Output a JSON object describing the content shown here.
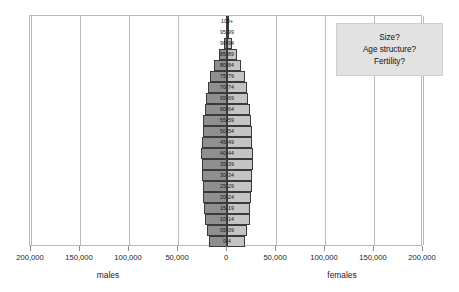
{
  "chart_data": {
    "type": "bar",
    "chart_subtype": "population-pyramid",
    "title": "",
    "xlabel": "",
    "ylabel": "",
    "xlim": [
      -200000,
      200000
    ],
    "grid": true,
    "legend_position": "none",
    "axis_side_labels": {
      "left": "males",
      "right": "females"
    },
    "xticks": [
      -200000,
      -150000,
      -100000,
      -50000,
      0,
      50000,
      100000,
      150000,
      200000
    ],
    "xtick_labels": [
      "200,000",
      "150,000",
      "100,000",
      "50,000",
      "0",
      "50,000",
      "100,000",
      "150,000",
      "200,000"
    ],
    "categories": [
      "100+",
      "95-99",
      "90-94",
      "85-89",
      "80-84",
      "75-79",
      "70-74",
      "65-69",
      "60-64",
      "55-59",
      "50-54",
      "45-49",
      "40-44",
      "35-39",
      "30-34",
      "25-29",
      "20-24",
      "15-19",
      "10-14",
      "05-09",
      "0-4"
    ],
    "series": [
      {
        "name": "males",
        "color": "#8f8f8f",
        "direction": "left",
        "values": [
          500,
          1500,
          3500,
          8000,
          13000,
          17000,
          19500,
          21000,
          22500,
          24000,
          24500,
          25500,
          26500,
          26000,
          25500,
          25000,
          24000,
          23000,
          22500,
          20000,
          18000
        ]
      },
      {
        "name": "females",
        "color": "#c4c4c4",
        "direction": "right",
        "values": [
          800,
          2500,
          5500,
          10000,
          14500,
          18000,
          20000,
          21500,
          23000,
          24500,
          25000,
          26000,
          27000,
          26500,
          26000,
          25500,
          24500,
          23500,
          23000,
          20500,
          18500
        ]
      }
    ]
  },
  "callout": {
    "lines": [
      "Size?",
      "Age structure?",
      "Fertility?"
    ],
    "background": "#e2e2e2"
  }
}
